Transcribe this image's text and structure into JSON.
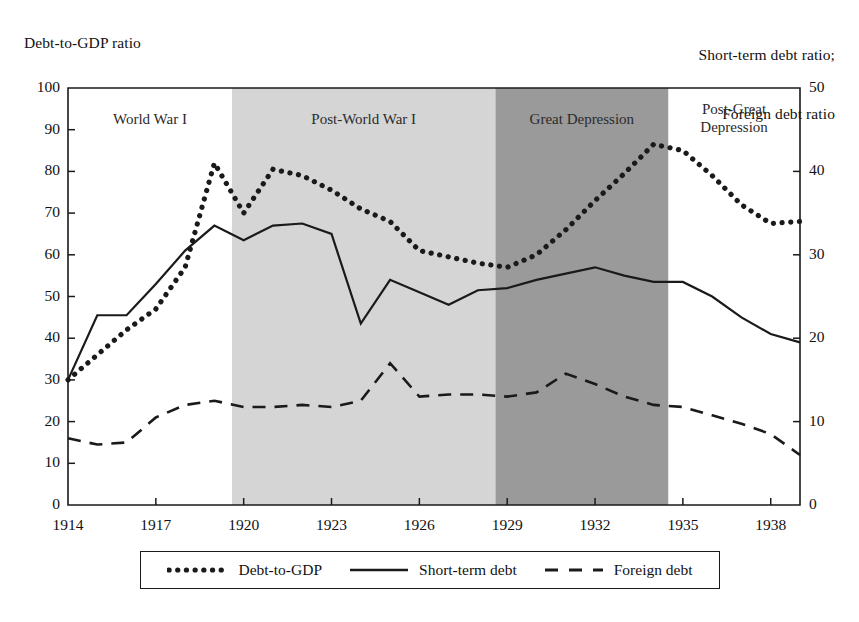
{
  "axes": {
    "left_title": "Debt-to-GDP ratio",
    "right_title_line1": "Short-term debt ratio;",
    "right_title_line2": "Foreign debt ratio",
    "left_ticks": [
      "100",
      "90",
      "80",
      "70",
      "60",
      "50",
      "40",
      "30",
      "20",
      "10",
      "0"
    ],
    "right_ticks": [
      "50",
      "40",
      "30",
      "20",
      "10",
      "0"
    ],
    "x_ticks": [
      "1914",
      "1917",
      "1920",
      "1923",
      "1926",
      "1929",
      "1932",
      "1935",
      "1938"
    ]
  },
  "bands": [
    {
      "label": "World War I",
      "start": 1914,
      "end": 1919.6,
      "color": "#ffffff"
    },
    {
      "label": "Post-World War I",
      "start": 1919.6,
      "end": 1928.6,
      "color": "#d5d5d5"
    },
    {
      "label": "Great Depression",
      "start": 1928.6,
      "end": 1934.5,
      "color": "#9a9a9a"
    },
    {
      "label": "Post-Great\nDepression",
      "start": 1934.5,
      "end": 1939,
      "color": "#ffffff"
    }
  ],
  "legend": [
    {
      "label": "Debt-to-GDP",
      "style": "dotted"
    },
    {
      "label": "Short-term debt",
      "style": "solid"
    },
    {
      "label": "Foreign debt",
      "style": "dashed"
    }
  ],
  "colors": {
    "line": "#1a1a1a",
    "frame": "#1a1a1a",
    "band_light": "#d5d5d5",
    "band_dark": "#9a9a9a",
    "background": "#ffffff"
  },
  "chart_data": {
    "type": "line",
    "title": "",
    "xlabel": "",
    "ylabel": "Debt-to-GDP ratio",
    "ylabel_right": "Short-term debt ratio; Foreign debt ratio",
    "xlim": [
      1914,
      1939
    ],
    "ylim": [
      0,
      100
    ],
    "ylim_right": [
      0,
      50
    ],
    "grid": false,
    "legend_position": "bottom",
    "x": [
      1914,
      1915,
      1916,
      1917,
      1918,
      1919,
      1920,
      1921,
      1922,
      1923,
      1924,
      1925,
      1926,
      1927,
      1928,
      1929,
      1930,
      1931,
      1932,
      1933,
      1934,
      1935,
      1936,
      1937,
      1938,
      1939
    ],
    "series": [
      {
        "name": "Debt-to-GDP",
        "axis": "left",
        "style": "dotted",
        "values": [
          30,
          36,
          42,
          47,
          57,
          82,
          70,
          80.5,
          79,
          75.5,
          71,
          68,
          61,
          59.5,
          58,
          57,
          60,
          66,
          73,
          79.5,
          86.5,
          85,
          79,
          72,
          67.5,
          68
        ]
      },
      {
        "name": "Short-term debt",
        "axis": "right",
        "style": "solid",
        "values": [
          15,
          22.75,
          22.75,
          26.5,
          30.5,
          33.5,
          31.75,
          33.5,
          33.75,
          32.5,
          21.75,
          27,
          25.5,
          24,
          25.75,
          26,
          27,
          27.75,
          28.5,
          27.5,
          26.75,
          26.75,
          25,
          22.5,
          20.5,
          19.5
        ]
      },
      {
        "name": "Foreign debt",
        "axis": "right",
        "style": "dashed",
        "values": [
          8,
          7.25,
          7.5,
          10.5,
          12,
          12.5,
          11.75,
          11.75,
          12,
          11.75,
          12.5,
          17,
          13,
          13.25,
          13.25,
          13,
          13.5,
          15.75,
          14.5,
          13,
          12,
          11.75,
          10.75,
          9.75,
          8.5,
          6
        ]
      }
    ]
  }
}
